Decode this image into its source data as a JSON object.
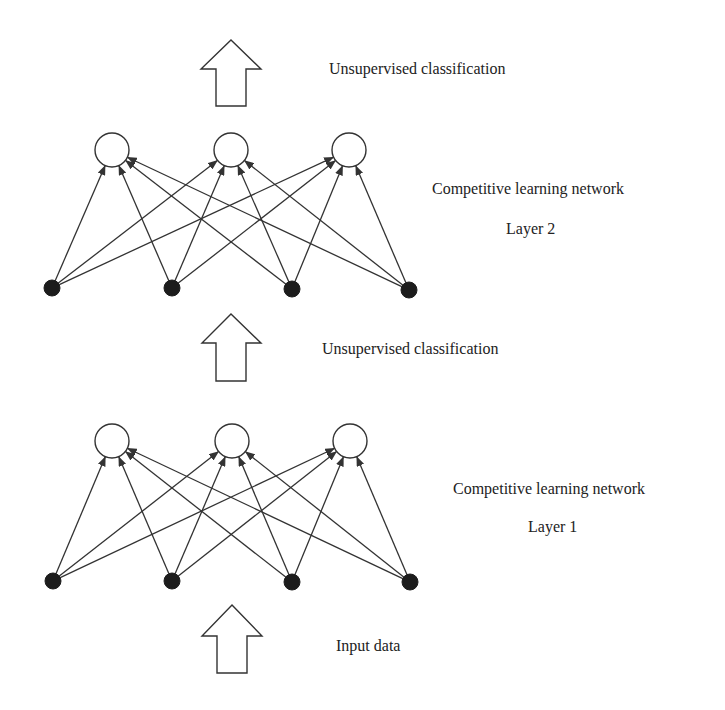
{
  "diagram": {
    "colors": {
      "stroke": "#333333",
      "input_node_fill": "#1c1c1c",
      "output_node_fill": "#ffffff",
      "background": "#ffffff",
      "text": "#222222"
    },
    "labels": {
      "top_arrow": "Unsupervised classification",
      "layer2_network": "Competitive learning network",
      "layer2_name": "Layer 2",
      "middle_arrow": "Unsupervised classification",
      "layer1_network": "Competitive learning network",
      "layer1_name": "Layer 1",
      "bottom_arrow": "Input data"
    },
    "layers": [
      {
        "name": "Layer 2",
        "input_nodes": [
          [
            52,
            288
          ],
          [
            172,
            288
          ],
          [
            292,
            289
          ],
          [
            409,
            290
          ]
        ],
        "output_nodes": [
          [
            112,
            150
          ],
          [
            231,
            150
          ],
          [
            349,
            150
          ]
        ],
        "input_radius": 8,
        "output_radius": 17,
        "connection": "fully-connected"
      },
      {
        "name": "Layer 1",
        "input_nodes": [
          [
            53,
            581
          ],
          [
            172,
            581
          ],
          [
            292,
            582
          ],
          [
            410,
            582
          ]
        ],
        "output_nodes": [
          [
            112,
            441
          ],
          [
            232,
            441
          ],
          [
            350,
            441
          ]
        ],
        "input_radius": 8,
        "output_radius": 17,
        "connection": "fully-connected"
      }
    ],
    "flow_arrows": [
      {
        "name": "top",
        "tip": [
          231,
          40
        ],
        "head_base_y": 69,
        "head_left": 201,
        "head_right": 261,
        "shaft_left": 216,
        "shaft_right": 246,
        "bottom": 106
      },
      {
        "name": "middle",
        "tip": [
          231,
          314
        ],
        "head_base_y": 343,
        "head_left": 202,
        "head_right": 261,
        "shaft_left": 216,
        "shaft_right": 246,
        "bottom": 381
      },
      {
        "name": "bottom",
        "tip": [
          232,
          605
        ],
        "head_base_y": 636,
        "head_left": 202,
        "head_right": 262,
        "shaft_left": 217,
        "shaft_right": 247,
        "bottom": 673
      }
    ]
  }
}
